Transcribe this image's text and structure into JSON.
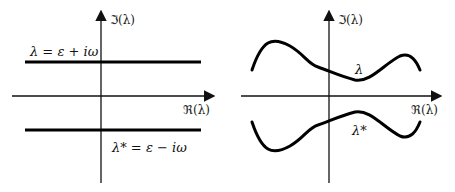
{
  "left_panel": {
    "imag_axis_label": "ℑ(λ)",
    "real_axis_label": "ℜ(λ)",
    "upper_line_label": "λ = ε + iω",
    "lower_line_label": "λ* = ε − iω"
  },
  "right_panel": {
    "imag_axis_label": "ℑ(λ)",
    "real_axis_label": "ℜ(λ)",
    "upper_curve_label": "λ",
    "lower_curve_label": "λ*"
  },
  "colors": {
    "axis": "#111111",
    "curve": "#000000"
  }
}
